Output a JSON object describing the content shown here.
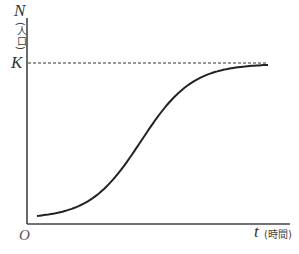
{
  "chart_data": {
    "type": "line",
    "title": "",
    "subtitle": "",
    "xlabel": "t (時間)",
    "ylabel": "N (人口)",
    "x_axis": {
      "symbol": "t",
      "unit": "(時間)",
      "origin_label": "O",
      "ticks": []
    },
    "y_axis": {
      "symbol": "N",
      "unit": "(人口)",
      "ticks": [
        "K"
      ]
    },
    "grid": false,
    "legend": null,
    "annotations": [
      {
        "type": "horizontal-dashed-line",
        "label": "K",
        "meaning": "carrying capacity (asymptote)"
      }
    ],
    "series": [
      {
        "name": "logistic growth curve",
        "shape": "sigmoid",
        "x": [
          0.0,
          0.1,
          0.2,
          0.3,
          0.4,
          0.5,
          0.6,
          0.7,
          0.8,
          0.9,
          1.0
        ],
        "y": [
          0.05,
          0.08,
          0.15,
          0.28,
          0.46,
          0.64,
          0.79,
          0.89,
          0.95,
          0.98,
          0.995
        ]
      }
    ],
    "xlim": [
      0,
      1
    ],
    "ylim": [
      0,
      1.15
    ]
  },
  "labels": {
    "y_symbol": "N",
    "y_unit": "(人口)",
    "k_label": "K",
    "origin": "O",
    "x_symbol": "t",
    "x_unit": "(時間)"
  },
  "colors": {
    "axis": "#444444",
    "curve": "#222222",
    "dashed": "#333333"
  }
}
